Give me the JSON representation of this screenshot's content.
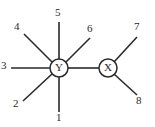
{
  "diagram": {
    "type": "node-edge-graph",
    "background_color": "#ffffff",
    "line_color": "#2a2a2a",
    "nodes": [
      {
        "id": "Y",
        "label": "Y",
        "cx": 59,
        "cy": 68,
        "r": 9
      },
      {
        "id": "X",
        "label": "X",
        "cx": 108,
        "cy": 68,
        "r": 9
      }
    ],
    "central_bond": {
      "from": "Y",
      "to": "X",
      "x1": 68,
      "y1": 68,
      "x2": 99,
      "y2": 68
    },
    "edges": [
      {
        "label": "1",
        "node": "Y",
        "x1": 59,
        "y1": 77,
        "x2": 59,
        "y2": 112,
        "label_x": 56,
        "label_y": 112
      },
      {
        "label": "2",
        "node": "Y",
        "x1": 52,
        "y1": 74,
        "x2": 23,
        "y2": 101,
        "label_x": 13,
        "label_y": 98
      },
      {
        "label": "3",
        "node": "Y",
        "x1": 50,
        "y1": 68,
        "x2": 11,
        "y2": 68,
        "label_x": 1,
        "label_y": 60
      },
      {
        "label": "4",
        "node": "Y",
        "x1": 52,
        "y1": 62,
        "x2": 24,
        "y2": 34,
        "label_x": 14,
        "label_y": 21
      },
      {
        "label": "5",
        "node": "Y",
        "x1": 59,
        "y1": 59,
        "x2": 59,
        "y2": 22,
        "label_x": 55,
        "label_y": 7
      },
      {
        "label": "6",
        "node": "Y",
        "x1": 66,
        "y1": 62,
        "x2": 90,
        "y2": 38,
        "label_x": 87,
        "label_y": 23
      },
      {
        "label": "7",
        "node": "X",
        "x1": 114,
        "y1": 62,
        "x2": 137,
        "y2": 37,
        "label_x": 134,
        "label_y": 21
      },
      {
        "label": "8",
        "node": "X",
        "x1": 114,
        "y1": 74,
        "x2": 137,
        "y2": 95,
        "label_x": 136,
        "label_y": 95
      }
    ]
  }
}
